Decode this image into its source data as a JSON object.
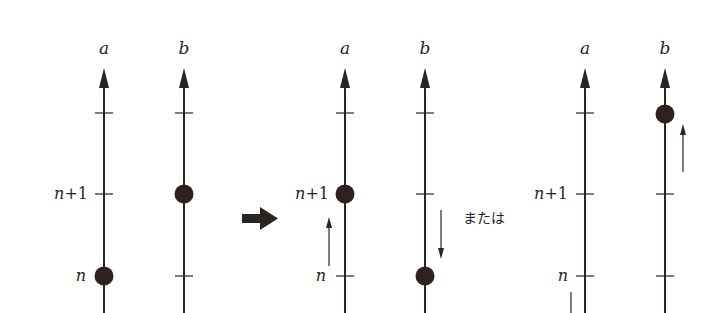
{
  "diagram": {
    "colors": {
      "ink": "#2a2422",
      "dot": "#2e2220",
      "background": "#ffffff"
    },
    "axis_labels": {
      "a": "a",
      "b": "b"
    },
    "level_labels": {
      "n": "n",
      "n_plus_1_var": "n",
      "n_plus_1_suffix": "+1"
    },
    "or_text": "または",
    "panels": [
      {
        "name": "before",
        "axes": [
          {
            "label": "a",
            "dot_level": "n"
          },
          {
            "label": "b",
            "dot_level": "n+1"
          }
        ]
      },
      {
        "name": "after-option-1",
        "axes": [
          {
            "label": "a",
            "dot_level": "n+1",
            "move": "up"
          },
          {
            "label": "b",
            "dot_level": "n",
            "move": "down"
          }
        ]
      },
      {
        "name": "after-option-2",
        "axes": [
          {
            "label": "a",
            "dot_level": "below-n",
            "move": "up"
          },
          {
            "label": "b",
            "dot_level": "n+2",
            "move": "up"
          }
        ]
      }
    ],
    "transition_arrow": "right-arrow"
  }
}
